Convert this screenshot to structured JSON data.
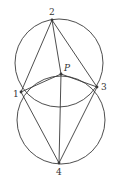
{
  "diagram": {
    "circles": [
      {
        "name": "upper-circle",
        "cx": 59,
        "cy": 63,
        "r": 44
      },
      {
        "name": "lower-circle",
        "cx": 61,
        "cy": 120,
        "r": 44
      }
    ],
    "points": {
      "p1": {
        "label": "1",
        "x": 21,
        "y": 92,
        "lx": 13,
        "ly": 97
      },
      "p2": {
        "label": "2",
        "x": 52,
        "y": 20,
        "lx": 49,
        "ly": 15
      },
      "p3": {
        "label": "3",
        "x": 97,
        "y": 87,
        "lx": 101,
        "ly": 90
      },
      "p4": {
        "label": "4",
        "x": 59,
        "y": 163,
        "lx": 56,
        "ly": 175
      },
      "pP": {
        "label": "P",
        "x": 61,
        "y": 74,
        "lx": 64,
        "ly": 71
      }
    },
    "segments": [
      [
        "p2",
        "p1"
      ],
      [
        "p2",
        "p3"
      ],
      [
        "p2",
        "pP"
      ],
      [
        "p1",
        "pP"
      ],
      [
        "p3",
        "pP"
      ],
      [
        "pP",
        "p4"
      ],
      [
        "p1",
        "p4"
      ],
      [
        "p3",
        "p4"
      ]
    ],
    "colors": {
      "stroke": "#3a3a3a",
      "background": "#ffffff"
    }
  }
}
